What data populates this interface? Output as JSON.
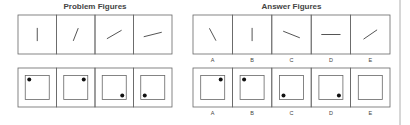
{
  "problem": {
    "title": "Problem Figures",
    "row1": [
      {
        "angle_deg": 90
      },
      {
        "angle_deg": 75
      },
      {
        "angle_deg": 40
      },
      {
        "angle_deg": 20
      }
    ],
    "row2": [
      {
        "dot": "top-left"
      },
      {
        "dot": "top-right"
      },
      {
        "dot": "bottom-right"
      },
      {
        "dot": "bottom-left"
      }
    ]
  },
  "answers": {
    "title": "Answer Figures",
    "labels": [
      "A",
      "B",
      "C",
      "D",
      "E"
    ],
    "row1": [
      {
        "label": "A",
        "angle_deg": 110
      },
      {
        "label": "B",
        "angle_deg": 90
      },
      {
        "label": "C",
        "angle_deg": 150
      },
      {
        "label": "D",
        "angle_deg": 180
      },
      {
        "label": "E",
        "angle_deg": 45
      }
    ],
    "row2": [
      {
        "label": "A",
        "dot": "top-right"
      },
      {
        "label": "B",
        "dot": "top-left"
      },
      {
        "label": "C",
        "dot": "bottom-left"
      },
      {
        "label": "D",
        "dot": "bottom-right"
      },
      {
        "label": "E",
        "dot": "none"
      }
    ]
  },
  "colors": {
    "stroke": "#666666",
    "figure": "#555555",
    "dot": "#111111"
  }
}
